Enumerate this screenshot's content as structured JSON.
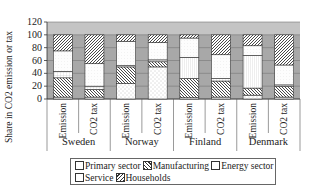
{
  "chart_data": {
    "type": "bar",
    "stacked": true,
    "title": "",
    "xlabel": "",
    "ylabel": "Share in CO2 emission or tax",
    "ylim": [
      0,
      120
    ],
    "yticks": [
      0,
      20,
      40,
      60,
      80,
      100,
      120
    ],
    "grid": true,
    "legend_position": "bottom",
    "groups": [
      "Sweden",
      "Norway",
      "Finland",
      "Denmark"
    ],
    "categories": [
      "Emission",
      "CO2 tax",
      "Emission",
      "CO2 tax",
      "Emission",
      "CO2 tax",
      "Emission",
      "CO2 tax"
    ],
    "series": [
      {
        "name": "Primary sector",
        "pattern": "dots",
        "values": [
          3,
          3,
          24,
          50,
          2,
          3,
          6,
          3
        ]
      },
      {
        "name": "Manufacturing",
        "pattern": "backslash-hatch",
        "values": [
          30,
          12,
          26,
          8,
          30,
          25,
          11,
          17
        ]
      },
      {
        "name": "Energy sector",
        "pattern": "grid/vertical-lines",
        "values": [
          10,
          5,
          2,
          3,
          33,
          4,
          51,
          2
        ]
      },
      {
        "name": "Service",
        "pattern": "light-dots",
        "values": [
          32,
          35,
          38,
          27,
          30,
          37,
          15,
          31
        ]
      },
      {
        "name": "Households",
        "pattern": "slash-hatch",
        "values": [
          25,
          45,
          10,
          12,
          5,
          31,
          17,
          47
        ]
      }
    ]
  },
  "legend": {
    "row1": [
      "Primary sector",
      "Manufacturing",
      "Energy sector"
    ],
    "row2": [
      "Service",
      "Households"
    ]
  }
}
